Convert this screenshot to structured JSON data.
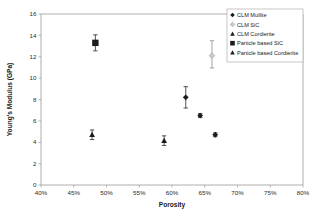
{
  "chart_data": {
    "type": "scatter",
    "title": "",
    "xlabel": "Porosity",
    "ylabel": "Young's Modulus (GPa)",
    "xlim": [
      40,
      80
    ],
    "ylim": [
      0,
      16
    ],
    "xtick_step": 5,
    "ytick_step": 2,
    "xticks": [
      "40%",
      "45%",
      "50%",
      "55%",
      "60%",
      "65%",
      "70%",
      "75%",
      "80%"
    ],
    "xtick_values": [
      40,
      45,
      50,
      55,
      60,
      65,
      70,
      75,
      80
    ],
    "yticks": [
      "0",
      "2",
      "4",
      "6",
      "8",
      "10",
      "12",
      "14",
      "16"
    ],
    "ytick_values": [
      0,
      2,
      4,
      6,
      8,
      10,
      12,
      14,
      16
    ],
    "grid": false,
    "legend_position": "top-right",
    "x_unit": "%",
    "y_unit": "GPa",
    "series": [
      {
        "name": "CLM Mullite",
        "marker": "diamond",
        "color": "#1c1c1c",
        "points": [
          {
            "x": 62.1,
            "y": 8.2,
            "yerr_low": 1.0,
            "yerr_high": 1.0
          },
          {
            "x": 64.3,
            "y": 6.5,
            "yerr_low": 0.18,
            "yerr_high": 0.18
          },
          {
            "x": 66.6,
            "y": 4.7,
            "yerr_low": 0.18,
            "yerr_high": 0.18
          }
        ]
      },
      {
        "name": "CLM SiC",
        "marker": "diamond-light",
        "color": "#c9c9c9",
        "points": [
          {
            "x": 66.1,
            "y": 12.1,
            "yerr_low": 1.15,
            "yerr_high": 1.4
          }
        ]
      },
      {
        "name": "CLM Cordierite",
        "marker": "triangle",
        "color": "#4a4a4a",
        "points": [
          {
            "x": 58.8,
            "y": 4.15,
            "yerr_low": 0.45,
            "yerr_high": 0.45
          }
        ]
      },
      {
        "name": "Particle based SiC",
        "marker": "square",
        "color": "#1c1c1c",
        "points": [
          {
            "x": 48.3,
            "y": 13.3,
            "yerr_low": 0.75,
            "yerr_high": 0.75
          }
        ]
      },
      {
        "name": "Particle based Cordierite",
        "marker": "triangle-filled",
        "color": "#1c1c1c",
        "points": [
          {
            "x": 47.8,
            "y": 4.7,
            "yerr_low": 0.45,
            "yerr_high": 0.45
          }
        ]
      }
    ]
  },
  "legend": {
    "items": [
      {
        "label": "CLM Mullite",
        "marker": "diamond"
      },
      {
        "label": "CLM SiC",
        "marker": "diamond-light"
      },
      {
        "label": "CLM Cordierite",
        "marker": "triangle"
      },
      {
        "label": "Particle based SiC",
        "marker": "square"
      },
      {
        "label": "Particle based Cordierite",
        "marker": "triangle-filled"
      }
    ]
  }
}
